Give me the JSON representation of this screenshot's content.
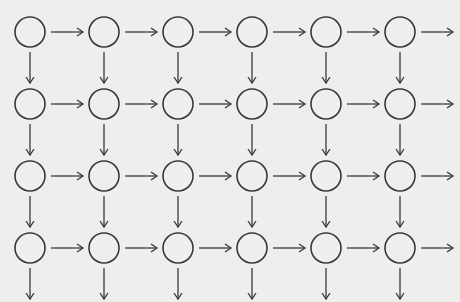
{
  "diagram": {
    "title": "",
    "rows": 4,
    "cols": 6,
    "node_shape": "circle",
    "node_labels": [],
    "edges": {
      "right_arrows": "from every node to the right (last column arrow points off-grid)",
      "down_arrows": "from every node downward (last row arrow points off-grid)"
    },
    "colors": {
      "stroke": "#3a3a3a",
      "background": "#eeeeec",
      "bleed_text": "#d6d6d2"
    }
  }
}
